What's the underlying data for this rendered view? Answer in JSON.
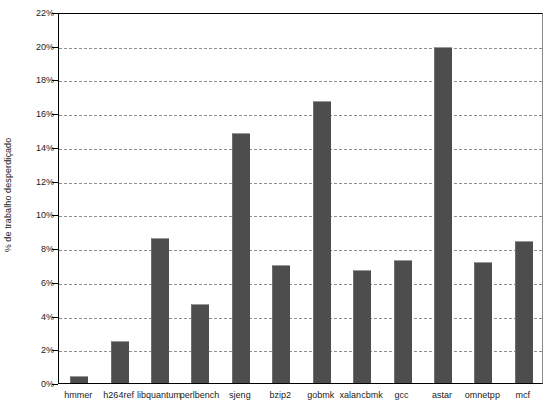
{
  "chart_data": {
    "type": "bar",
    "title": "",
    "subtitle": "",
    "xlabel": "",
    "ylabel": "% de trabalho desperdiçado",
    "categories": [
      "hmmer",
      "h264ref",
      "libquantum",
      "perlbench",
      "sjeng",
      "bzip2",
      "gobmk",
      "xalancbmk",
      "gcc",
      "astar",
      "omnetpp",
      "mcf"
    ],
    "values": [
      0.4,
      2.5,
      8.6,
      4.7,
      14.8,
      7.0,
      16.7,
      6.7,
      7.3,
      19.9,
      7.2,
      8.4
    ],
    "value_labels": [
      "0.4%",
      "2.5%",
      "8.6%",
      "4.7%",
      "14.8%",
      "7.0%",
      "16.7%",
      "6.7%",
      "7.3%",
      "19.9%",
      "7.2%",
      "8.4%"
    ],
    "ylim": [
      0,
      22
    ],
    "ytick_values": [
      0,
      2,
      4,
      6,
      8,
      10,
      12,
      14,
      16,
      18,
      20,
      22
    ],
    "ytick_labels": [
      "0%",
      "2%",
      "4%",
      "6%",
      "8%",
      "10%",
      "12%",
      "14%",
      "16%",
      "18%",
      "20%",
      "22%"
    ],
    "grid": true,
    "grid_axis": "y",
    "grid_style": "dashed",
    "legend": false,
    "legend_position": "none",
    "bar_color": "#4d4d4d",
    "background_color": "#ffffff",
    "axis_color": "#000000",
    "gridline_color": "#7a7a7a",
    "series": [
      {
        "name": "% de trabalho desperdiçado",
        "values": [
          0.4,
          2.5,
          8.6,
          4.7,
          14.8,
          7.0,
          16.7,
          6.7,
          7.3,
          19.9,
          7.2,
          8.4
        ]
      }
    ]
  }
}
